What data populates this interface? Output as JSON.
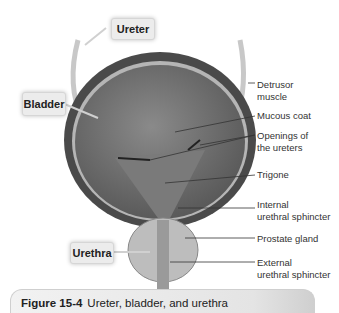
{
  "figure": {
    "number": "Figure 15-4",
    "title": "Ureter, bladder, and urethra"
  },
  "callouts": {
    "ureter": "Ureter",
    "bladder": "Bladder",
    "urethra": "Urethra"
  },
  "labels": {
    "detrusor": "Detrusor\nmuscle",
    "mucous": "Mucous coat",
    "openings": "Openings of\nthe ureters",
    "trigone": "Trigone",
    "internal": "Internal\nurethral sphincter",
    "prostate": "Prostate gland",
    "external": "External\nurethral sphincter"
  }
}
